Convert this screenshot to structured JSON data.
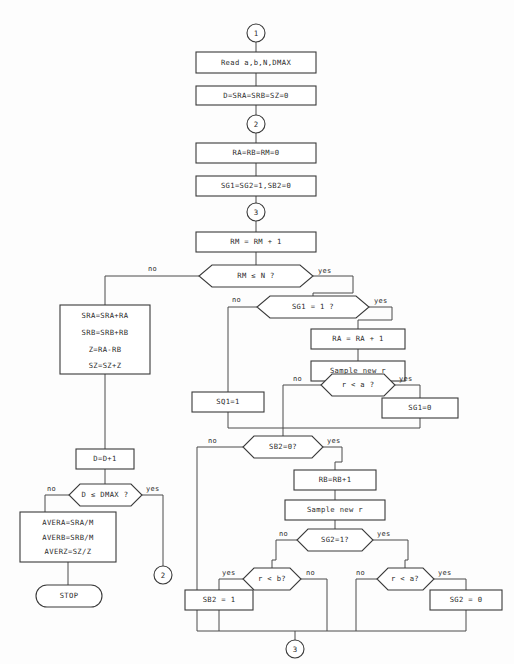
{
  "diagram": {
    "colors": {
      "background": "#fdfdfd",
      "stroke": "#3a3a3a",
      "link": "#4a4a4a",
      "text": "#2b2b2b",
      "shape_fill": "#ffffff"
    }
  },
  "connectors": [
    {
      "id": "c1",
      "label": "1"
    },
    {
      "id": "c2_top",
      "label": "2"
    },
    {
      "id": "c3_top",
      "label": "3"
    },
    {
      "id": "c2_bottom",
      "label": "2"
    },
    {
      "id": "c3_bottom",
      "label": "3"
    }
  ],
  "nodes": {
    "read": {
      "type": "process",
      "text": "Read a,b,N,DMAX"
    },
    "init_d": {
      "type": "process",
      "text": "D=SRA=SRB=SZ=0"
    },
    "init_ra": {
      "type": "process",
      "text": "RA=RB=RM=0"
    },
    "init_sg": {
      "type": "process",
      "text": "SG1=SG2=1,SB2=0"
    },
    "rm_inc": {
      "type": "process",
      "text": "RM = RM + 1"
    },
    "rm_test": {
      "type": "decision",
      "text": "RM ≤ N ?"
    },
    "sg1_test": {
      "type": "decision",
      "text": "SG1 = 1 ?"
    },
    "ra_inc": {
      "type": "process",
      "text": "RA = RA + 1"
    },
    "sample_r_a": {
      "type": "process",
      "text": "Sample new r"
    },
    "r_lt_a_top": {
      "type": "decision",
      "text": "r < a ?"
    },
    "sg1_set0": {
      "type": "process",
      "text": "SG1=0"
    },
    "sq1_set1": {
      "type": "process",
      "text": "SQ1=1"
    },
    "sb2_test": {
      "type": "decision",
      "text": "SB2=0?"
    },
    "rb_inc": {
      "type": "process",
      "text": "RB=RB+1"
    },
    "sample_r_b": {
      "type": "process",
      "text": "Sample new r"
    },
    "sg2_test": {
      "type": "decision",
      "text": "SG2=1?"
    },
    "r_lt_b": {
      "type": "decision",
      "text": "r < b?"
    },
    "sb2_set1": {
      "type": "process",
      "text": "SB2 = 1"
    },
    "r_lt_a_bot": {
      "type": "decision",
      "text": "r < a?"
    },
    "sg2_set0": {
      "type": "process",
      "text": "SG2 = 0"
    },
    "accumulate": {
      "type": "process-multiline",
      "lines": [
        "SRA=SRA+RA",
        "SRB=SRB+RB",
        "Z=RA-RB",
        "SZ=SZ+Z"
      ]
    },
    "d_inc": {
      "type": "process",
      "text": "D=D+1"
    },
    "d_test": {
      "type": "decision",
      "text": "D ≤ DMAX ?"
    },
    "averages": {
      "type": "process-multiline",
      "lines": [
        "AVERA=SRA/M",
        "AVERB=SRB/M",
        "AVERZ=SZ/Z"
      ]
    },
    "stop": {
      "type": "terminal",
      "text": "STOP"
    }
  },
  "edge_labels": {
    "rm_test_no": "no",
    "rm_test_yes": "yes",
    "sg1_test_no": "no",
    "sg1_test_yes": "yes",
    "r_lt_a_top_no": "no",
    "r_lt_a_top_yes": "yes",
    "sb2_test_no": "no",
    "sb2_test_yes": "yes",
    "sg2_test_no": "no",
    "sg2_test_yes": "yes",
    "r_lt_b_yes": "yes",
    "r_lt_b_no": "no",
    "r_lt_a_bot_no": "no",
    "r_lt_a_bot_yes": "yes",
    "d_test_no": "no",
    "d_test_yes": "yes"
  }
}
